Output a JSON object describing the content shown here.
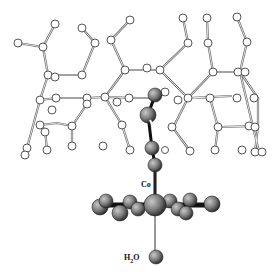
{
  "diagram": {
    "type": "molecular-structure",
    "labels": {
      "metal": "Co",
      "axial_ligand": "H2O",
      "axial_ligand_sub": "2"
    },
    "colors": {
      "framework_atom_fill": "#ffffff",
      "framework_stroke": "#555555",
      "dark_atom_fill": "#7a7a7a",
      "dark_atom_stroke": "#222222"
    }
  }
}
